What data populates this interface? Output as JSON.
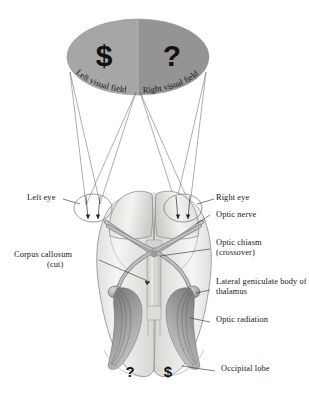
{
  "figure": {
    "background_color": "#ffffff"
  },
  "visual_field": {
    "left": {
      "label": "Left visual field",
      "symbol": "$",
      "fill_color": "#a6a6a6"
    },
    "right": {
      "label": "Right visual field",
      "symbol": "?",
      "fill_color": "#969696"
    }
  },
  "eyes": {
    "left_label": "Left eye",
    "right_label": "Right eye"
  },
  "labels": {
    "corpus_callosum": "Corpus callosum",
    "corpus_callosum_sub": "(cut)",
    "optic_nerve": "Optic nerve",
    "optic_chiasm": "Optic chiasm",
    "optic_chiasm_sub": "(crossover)",
    "lateral_geniculate": "Lateral geniculate body of thalamus",
    "optic_radiation": "Optic radiation",
    "occipital_lobe": "Occipital lobe"
  },
  "occipital_symbols": {
    "left_hemisphere": "?",
    "right_hemisphere": "$"
  },
  "colors": {
    "brain_fill": "#f2f1ef",
    "brain_stroke": "#8d8d8d",
    "tract_fill": "#b3b3b3",
    "tract_stroke": "#6e6e6e",
    "radiation_dark": "#5f5f61",
    "leader_line": "#2b2b2b",
    "symbol_color": "#121212",
    "text_color": "#17171a"
  }
}
